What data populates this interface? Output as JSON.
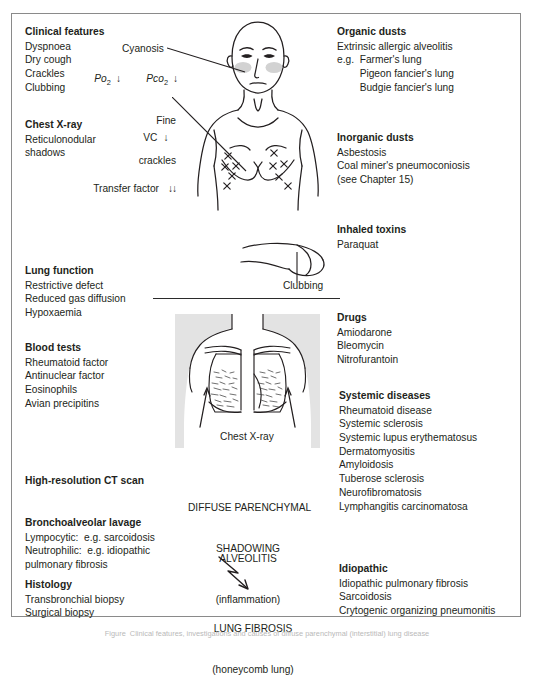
{
  "figure": {
    "caption": "Figure  Clinical features, investigations and causes of diffuse parenchymal (interstitial) lung disease"
  },
  "left_column": {
    "clinical_features": {
      "heading": "Clinical features",
      "items": [
        "Dyspnoea",
        "Dry cough",
        "Crackles",
        "Clubbing"
      ]
    },
    "chest_xray": {
      "heading": "Chest X-ray",
      "items": [
        "Reticulonodular",
        "shadows"
      ]
    },
    "lung_function": {
      "heading": "Lung function",
      "items": [
        "Restrictive defect",
        "Reduced gas diffusion",
        "Hypoxaemia"
      ]
    },
    "blood_tests": {
      "heading": "Blood tests",
      "items": [
        "Rheumatoid factor",
        "Antinuclear factor",
        "Eosinophils",
        "Avian precipitins"
      ]
    },
    "hrct": {
      "heading": "High-resolution CT scan"
    },
    "bal": {
      "heading": "Bronchoalveolar lavage",
      "items": [
        "Lympocytic:  e.g. sarcoidosis",
        "Neutrophilic:  e.g. idiopathic",
        "pulmonary fibrosis"
      ]
    },
    "histology": {
      "heading": "Histology",
      "items": [
        "Transbronchial biopsy",
        "Surgical biopsy"
      ]
    }
  },
  "annotations": {
    "cyanosis": "Cyanosis",
    "po2": "Po",
    "po2_sub": "2",
    "po2_arrow": "↓",
    "pco2": "Pco",
    "pco2_sub": "2",
    "pco2_arrow": "↓",
    "fine_crackles_line1": "Fine",
    "fine_crackles_line2": "crackles",
    "vc": "VC",
    "vc_arrow": "↓",
    "transfer_factor": "Transfer factor",
    "transfer_factor_arrow": "↓↓",
    "clubbing": "Clubbing",
    "chest_xray_caption": "Chest X-ray"
  },
  "center_column": {
    "diffuse_line1": "DIFFUSE PARENCHYMAL",
    "diffuse_line2": "SHADOWING",
    "alveolitis_line1": "ALVEOLITIS",
    "alveolitis_line2": "(inflammation)",
    "fibrosis_line1": "LUNG FIBROSIS",
    "fibrosis_line2": "(honeycomb lung)"
  },
  "right_column": {
    "organic_dusts": {
      "heading": "Organic dusts",
      "items": [
        "Extrinsic allergic alveolitis",
        "e.g.  Farmer's lung",
        "        Pigeon fancier's lung",
        "        Budgie fancier's lung"
      ]
    },
    "inorganic_dusts": {
      "heading": "Inorganic dusts",
      "items": [
        "Asbestosis",
        "Coal miner's pneumoconiosis",
        "(see Chapter 15)"
      ]
    },
    "inhaled_toxins": {
      "heading": "Inhaled toxins",
      "items": [
        "Paraquat"
      ]
    },
    "drugs": {
      "heading": "Drugs",
      "items": [
        "Amiodarone",
        "Bleomycin",
        "Nitrofurantoin"
      ]
    },
    "systemic_diseases": {
      "heading": "Systemic diseases",
      "items": [
        "Rheumatoid disease",
        "Systemic sclerosis",
        "Systemic lupus erythematosus",
        "Dermatomyositis",
        "Amyloidosis",
        "Tuberose sclerosis",
        "Neurofibromatosis",
        "Lymphangitis carcinomatosa"
      ]
    },
    "idiopathic": {
      "heading": "Idiopathic",
      "items": [
        "Idiopathic pulmonary fibrosis",
        "Sarcoidosis",
        "Crytogenic organizing pneumonitis"
      ]
    }
  },
  "colors": {
    "ink": "#231f20",
    "frame": "#8a8a8a",
    "xray_panel": "#e3e3e3"
  }
}
